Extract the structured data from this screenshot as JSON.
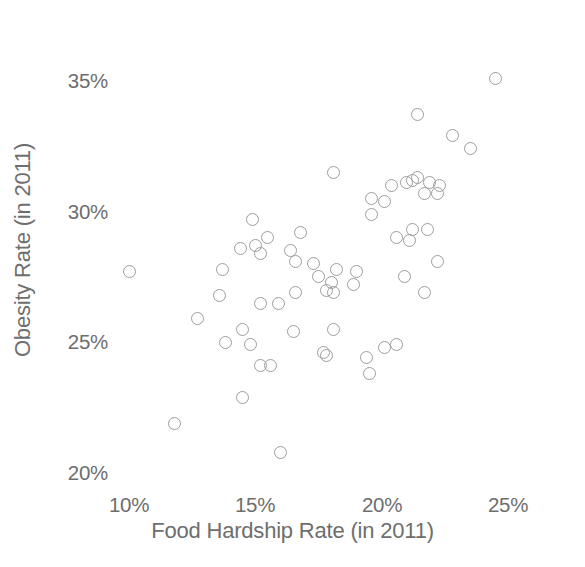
{
  "chart_data": {
    "type": "scatter",
    "title": "",
    "xlabel": "Food Hardship Rate (in 2011)",
    "ylabel": "Obesity Rate (in 2011)",
    "xlim": [
      8.5,
      26.0
    ],
    "ylim": [
      19.3,
      35.8
    ],
    "grid": false,
    "legend": null,
    "marker": {
      "shape": "open-circle",
      "color": "#9d9d9d",
      "size_px": 13,
      "stroke_px": 1.4,
      "fill": "none"
    },
    "xticks": [
      {
        "value": 10,
        "label": "10%",
        "px": 129
      },
      {
        "value": 15,
        "label": "15%",
        "px": 255
      },
      {
        "value": 20,
        "label": "20%",
        "px": 382
      },
      {
        "value": 25,
        "label": "25%",
        "px": 508
      }
    ],
    "yticks": [
      {
        "value": 35,
        "label": "35%",
        "px": 81
      },
      {
        "value": 30,
        "label": "30%",
        "px": 212
      },
      {
        "value": 25,
        "label": "25%",
        "px": 342
      },
      {
        "value": 20,
        "label": "20%",
        "px": 473
      }
    ],
    "axes_px": {
      "x0_px": 129,
      "x0_val": 10,
      "x_px_per_unit": 25.27,
      "y0_px": 81,
      "y0_val": 35,
      "y_px_per_unit": 26.13
    },
    "n_points": 62,
    "points": [
      {
        "x": 24.5,
        "y": 35.1
      },
      {
        "x": 21.4,
        "y": 33.7
      },
      {
        "x": 22.8,
        "y": 32.9
      },
      {
        "x": 23.5,
        "y": 32.4
      },
      {
        "x": 18.1,
        "y": 31.5
      },
      {
        "x": 21.4,
        "y": 31.3
      },
      {
        "x": 21.2,
        "y": 31.2
      },
      {
        "x": 21.0,
        "y": 31.1
      },
      {
        "x": 21.9,
        "y": 31.1
      },
      {
        "x": 20.4,
        "y": 31.0
      },
      {
        "x": 21.7,
        "y": 30.7
      },
      {
        "x": 22.2,
        "y": 30.7
      },
      {
        "x": 19.6,
        "y": 30.5
      },
      {
        "x": 20.1,
        "y": 30.4
      },
      {
        "x": 19.6,
        "y": 29.9
      },
      {
        "x": 14.9,
        "y": 29.7
      },
      {
        "x": 21.2,
        "y": 29.3
      },
      {
        "x": 21.8,
        "y": 29.3
      },
      {
        "x": 16.8,
        "y": 29.2
      },
      {
        "x": 15.5,
        "y": 29.0
      },
      {
        "x": 21.1,
        "y": 28.9
      },
      {
        "x": 15.0,
        "y": 28.7
      },
      {
        "x": 14.4,
        "y": 28.6
      },
      {
        "x": 15.2,
        "y": 28.4
      },
      {
        "x": 16.4,
        "y": 28.5
      },
      {
        "x": 16.6,
        "y": 28.1
      },
      {
        "x": 22.2,
        "y": 28.1
      },
      {
        "x": 13.7,
        "y": 27.8
      },
      {
        "x": 10.0,
        "y": 27.7
      },
      {
        "x": 18.2,
        "y": 27.8
      },
      {
        "x": 17.5,
        "y": 27.5
      },
      {
        "x": 18.0,
        "y": 27.3
      },
      {
        "x": 18.9,
        "y": 27.2
      },
      {
        "x": 18.1,
        "y": 26.9
      },
      {
        "x": 21.7,
        "y": 26.9
      },
      {
        "x": 16.6,
        "y": 26.9
      },
      {
        "x": 15.2,
        "y": 26.5
      },
      {
        "x": 12.7,
        "y": 25.9
      },
      {
        "x": 14.5,
        "y": 25.5
      },
      {
        "x": 18.1,
        "y": 25.5
      },
      {
        "x": 16.5,
        "y": 25.4
      },
      {
        "x": 13.8,
        "y": 25.0
      },
      {
        "x": 14.8,
        "y": 24.9
      },
      {
        "x": 20.1,
        "y": 24.8
      },
      {
        "x": 20.6,
        "y": 24.9
      },
      {
        "x": 17.7,
        "y": 24.6
      },
      {
        "x": 17.8,
        "y": 24.5
      },
      {
        "x": 19.4,
        "y": 24.4
      },
      {
        "x": 15.2,
        "y": 24.1
      },
      {
        "x": 15.6,
        "y": 24.1
      },
      {
        "x": 19.5,
        "y": 23.8
      },
      {
        "x": 14.5,
        "y": 22.9
      },
      {
        "x": 11.8,
        "y": 21.9
      },
      {
        "x": 16.0,
        "y": 20.8
      },
      {
        "x": 20.9,
        "y": 27.5
      },
      {
        "x": 19.0,
        "y": 27.7
      },
      {
        "x": 17.3,
        "y": 28.0
      },
      {
        "x": 20.6,
        "y": 29.0
      },
      {
        "x": 22.3,
        "y": 31.0
      },
      {
        "x": 17.8,
        "y": 27.0
      },
      {
        "x": 15.9,
        "y": 26.5
      },
      {
        "x": 13.6,
        "y": 26.8
      }
    ]
  },
  "axis": {
    "x_title": "Food Hardship Rate (in 2011)",
    "y_title": "Obesity Rate (in 2011)",
    "x_tick_labels": [
      "10%",
      "15%",
      "20%",
      "25%"
    ],
    "y_tick_labels": [
      "35%",
      "30%",
      "25%",
      "20%"
    ]
  },
  "colors": {
    "marker_stroke": "#9d9d9d",
    "text": "#6e6e6e",
    "background": "#ffffff"
  }
}
